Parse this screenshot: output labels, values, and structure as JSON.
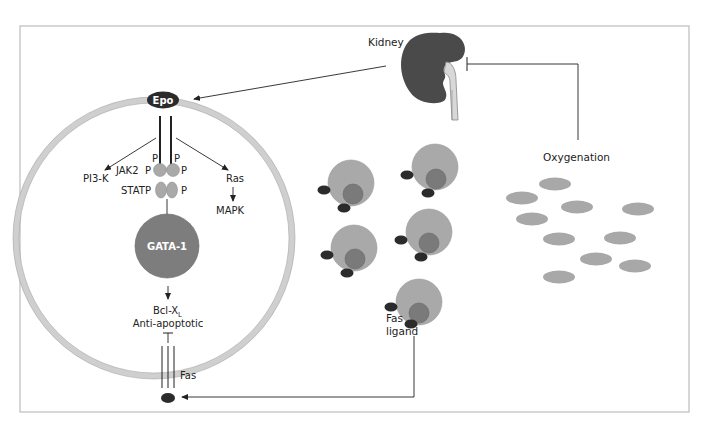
{
  "figure": {
    "labels": {
      "kidney": "Kidney",
      "epo": "Epo",
      "oxygenation": "Oxygenation",
      "pi3k": "PI3-K",
      "jak2": "JAK2",
      "stat": "STAT",
      "p": "P",
      "ras": "Ras",
      "mapk": "MAPK",
      "gata1": "GATA-1",
      "bclxl": "Bcl-X",
      "bclxl_sub": "L",
      "anti_apoptotic": "Anti-apoptotic",
      "fas": "Fas",
      "fas_ligand_1": "Fas",
      "fas_ligand_2": "ligand"
    },
    "colors": {
      "frame": "#bdbdbd",
      "kidney": "#4a4a4a",
      "membrane": "#cfcfcf",
      "cell_gray": "#a9a9a9",
      "nucleus": "#7a7a7a",
      "dark": "#2b2b2b",
      "gata": "#7d7d7d"
    }
  }
}
